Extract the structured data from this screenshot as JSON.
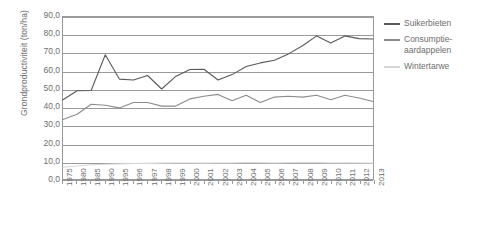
{
  "chart_data": {
    "type": "line",
    "title": "",
    "xlabel": "",
    "ylabel": "Grondproductiviteit (ton/ha)",
    "ylim": [
      0,
      90
    ],
    "ytick_labels": [
      "90,0",
      "80,0",
      "70,0",
      "60,0",
      "50,0",
      "40,0",
      "30,0",
      "20,0",
      "10,0",
      "0,0"
    ],
    "ytick_values": [
      90,
      80,
      70,
      60,
      50,
      40,
      30,
      20,
      10,
      0
    ],
    "grid": true,
    "legend_position": "right",
    "categories": [
      "1975",
      "1980",
      "1985",
      "1990",
      "1995",
      "1996",
      "1997",
      "1998",
      "1999",
      "2000",
      "2001",
      "2002",
      "2003",
      "2004",
      "2005",
      "2006",
      "2007",
      "2008",
      "2009",
      "2010",
      "2011",
      "2012",
      "2013"
    ],
    "series": [
      {
        "name": "Suikerbieten",
        "color": "#595959",
        "values": [
          44.0,
          49.0,
          49.2,
          69.0,
          55.5,
          55.0,
          57.5,
          50.0,
          57.0,
          60.8,
          61.0,
          55.0,
          58.0,
          62.5,
          64.5,
          66.0,
          69.5,
          74.0,
          79.5,
          75.5,
          79.5,
          78.0,
          77.8
        ]
      },
      {
        "name": "Consumptie-aardappelen",
        "color": "#8c8c8c",
        "values": [
          33.0,
          36.0,
          41.5,
          41.0,
          39.5,
          42.5,
          42.5,
          40.5,
          40.5,
          44.5,
          46.0,
          47.0,
          43.5,
          46.5,
          42.5,
          45.5,
          46.0,
          45.5,
          46.5,
          44.0,
          46.5,
          45.0,
          43.0
        ]
      },
      {
        "name": "Wintertarwe",
        "color": "#d6d6d6",
        "values": [
          6.5,
          7.2,
          7.9,
          8.2,
          8.4,
          8.6,
          8.7,
          8.8,
          8.9,
          8.9,
          8.8,
          8.9,
          8.9,
          9.2,
          9.0,
          8.9,
          9.0,
          9.1,
          9.1,
          8.9,
          9.0,
          8.9,
          8.8
        ]
      }
    ]
  },
  "legend": {
    "items": [
      {
        "label": "Suikerbieten"
      },
      {
        "label": "Consumptie-aardappelen"
      },
      {
        "label": "Wintertarwe"
      }
    ]
  }
}
